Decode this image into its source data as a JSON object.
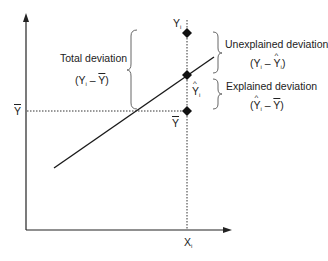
{
  "diagram": {
    "axes": {
      "x_label": "X",
      "x_label_subscript": "i",
      "y_mean_label": "Y"
    },
    "points": {
      "observed": {
        "label": "Y",
        "subscript": "i"
      },
      "predicted": {
        "label": "Y",
        "subscript": "i",
        "hat": true
      },
      "mean": {
        "label": "Y",
        "bar": true
      }
    },
    "annotations": {
      "total": {
        "title": "Total deviation",
        "formula": "(Y_i – Ȳ)"
      },
      "unexplained": {
        "title": "Unexplained deviation",
        "formula": "(Y_i – Ŷ_i)"
      },
      "explained": {
        "title": "Explained deviation",
        "formula": "(Ŷ_i – Ȳ)"
      }
    },
    "colors": {
      "line": "#1a1a1a",
      "text": "#222222",
      "brace": "#555555"
    }
  },
  "text": {
    "total_title": "Total deviation",
    "unexplained_title": "Unexplained deviation",
    "explained_title": "Explained deviation",
    "Y": "Y",
    "X": "X",
    "i": "i",
    "minus": " – "
  }
}
